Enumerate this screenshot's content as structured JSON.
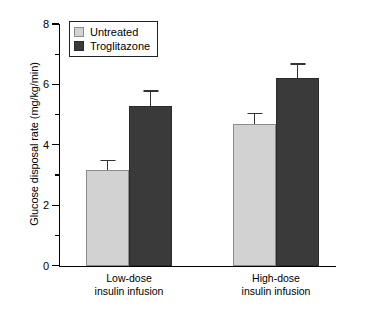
{
  "chart_data": {
    "type": "bar",
    "title": "",
    "xlabel": "",
    "ylabel": "Glucose disposal rate (mg/kg/min)",
    "ylim": [
      0,
      8
    ],
    "yticks": [
      0,
      2,
      4,
      6,
      8
    ],
    "ytick_labels": [
      "0",
      "2",
      "4",
      "6",
      "8"
    ],
    "yminor_ticks": [
      1,
      3,
      5,
      7
    ],
    "grid": false,
    "legend_position": "top-left",
    "categories": [
      "Low-dose insulin infusion",
      "High-dose insulin infusion"
    ],
    "category_lines": [
      [
        "Low-dose",
        "insulin infusion"
      ],
      [
        "High-dose",
        "insulin infusion"
      ]
    ],
    "series": [
      {
        "name": "Untreated",
        "color": "#d2d2d2",
        "values": [
          3.15,
          4.7
        ],
        "errors": [
          0.35,
          0.35
        ]
      },
      {
        "name": "Troglitazone",
        "color": "#3a3a3a",
        "values": [
          5.3,
          6.2
        ],
        "errors": [
          0.5,
          0.5
        ]
      }
    ]
  },
  "legend": {
    "items": [
      {
        "label": "Untreated",
        "swatch": "light-gray-swatch"
      },
      {
        "label": "Troglitazone",
        "swatch": "dark-gray-swatch"
      }
    ]
  },
  "axis": {
    "y_title": "Glucose disposal rate (mg/kg/min)",
    "y_labels": [
      "8",
      "6",
      "4",
      "2",
      "0"
    ]
  },
  "groups": [
    {
      "line1": "Low-dose",
      "line2": "insulin infusion"
    },
    {
      "line1": "High-dose",
      "line2": "insulin infusion"
    }
  ]
}
